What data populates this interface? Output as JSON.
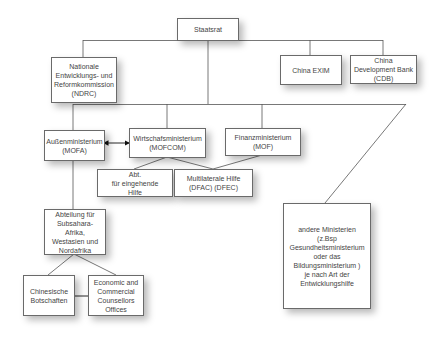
{
  "diagram": {
    "type": "org-chart",
    "colors": {
      "line": "#555555",
      "box_border": "#6a6a6a",
      "text": "#444444",
      "background": "#ffffff"
    },
    "nodes": {
      "staatsrat": {
        "label": "Staatsrat"
      },
      "ndrc": {
        "label": "Nationale\nEntwicklungs- und\nReformkommission\n(NDRC)"
      },
      "china_exim": {
        "label": "China EXIM"
      },
      "cdb": {
        "label": "China\nDevelopment Bank\n(CDB)"
      },
      "mofa": {
        "label": "Außenministerium\n(MOFA)"
      },
      "mofcom": {
        "label": "Wirtschafsministerium\n(MOFCOM)"
      },
      "mof": {
        "label": "Finanzministerium\n(MOF)"
      },
      "abt_eingehende_hilfe": {
        "label": "Abt.\nfür eingehende\nHilfe"
      },
      "multilaterale_hilfe": {
        "label": "Multilaterale Hilfe\n(DFAC) (DFEC)"
      },
      "andere_ministerien": {
        "label": "andere Ministerien\n(z.Bsp\nGesundheitsministerium\noder das\nBildungsministerium )\nje nach Art der\nEntwicklungshilfe"
      },
      "abteilung_afrika": {
        "label": "Abteilung für\nSubsahara-Afrika,\nWestasien und\nNordafrika"
      },
      "botschaften": {
        "label": "Chinesische\nBotschaften"
      },
      "counsellors": {
        "label": "Economic and\nCommercial\nCounsellors\nOffices"
      }
    },
    "edges": [
      {
        "from": "staatsrat",
        "to": "ndrc"
      },
      {
        "from": "staatsrat",
        "to": "china_exim"
      },
      {
        "from": "staatsrat",
        "to": "cdb"
      },
      {
        "from": "staatsrat",
        "to": "mofa"
      },
      {
        "from": "staatsrat",
        "to": "mofcom"
      },
      {
        "from": "staatsrat",
        "to": "mof"
      },
      {
        "from": "staatsrat",
        "to": "andere_ministerien"
      },
      {
        "from": "mofa",
        "to": "mofcom",
        "bidirectional": true
      },
      {
        "from": "mofcom",
        "to": "abt_eingehende_hilfe"
      },
      {
        "from": "mofcom",
        "to": "multilaterale_hilfe"
      },
      {
        "from": "mof",
        "to": "multilaterale_hilfe"
      },
      {
        "from": "mofa",
        "to": "abteilung_afrika"
      },
      {
        "from": "abteilung_afrika",
        "to": "botschaften"
      },
      {
        "from": "abteilung_afrika",
        "to": "counsellors"
      },
      {
        "from": "botschaften",
        "to": "counsellors",
        "bidirectional": true
      }
    ]
  }
}
